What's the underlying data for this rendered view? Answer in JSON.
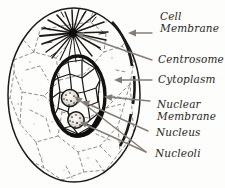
{
  "figure": {
    "background_color": "#fdfdfc",
    "ink_color": "#1c1a18",
    "leader_color": "#7f7a74",
    "labels": [
      {
        "name": "cell-membrane",
        "line1": "Cell",
        "line2": "Membrane"
      },
      {
        "name": "centrosome",
        "line1": "Centrosome",
        "line2": ""
      },
      {
        "name": "cytoplasm",
        "line1": "Cytoplasm",
        "line2": ""
      },
      {
        "name": "nuclear-membrane",
        "line1": "Nuclear",
        "line2": "Membrane"
      },
      {
        "name": "nucleus",
        "line1": "Nucleus",
        "line2": ""
      },
      {
        "name": "nucleoli",
        "line1": "Nucleoli",
        "line2": ""
      }
    ],
    "parts": {
      "cell_membrane": "Cell Membrane",
      "centrosome": "Centrosome",
      "cytoplasm": "Cytoplasm",
      "nuclear_membrane": "Nuclear Membrane",
      "nucleus": "Nucleus",
      "nucleoli": "Nucleoli"
    }
  }
}
